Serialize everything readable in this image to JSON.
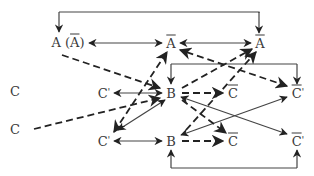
{
  "diagram": {
    "nodes": [
      {
        "id": "A",
        "label": "A (Ā)",
        "x": 68,
        "y": 41
      },
      {
        "id": "Abar1",
        "label": "Ā",
        "x": 170,
        "y": 43
      },
      {
        "id": "Abar2",
        "label": "Ā",
        "x": 260,
        "y": 43
      },
      {
        "id": "C_top",
        "label": "C",
        "x": 15,
        "y": 90
      },
      {
        "id": "C_bottom",
        "label": "C",
        "x": 15,
        "y": 128
      },
      {
        "id": "Cp_top",
        "label": "C'",
        "x": 104,
        "y": 93
      },
      {
        "id": "Cp_bottom",
        "label": "C'",
        "x": 104,
        "y": 141
      },
      {
        "id": "B_top",
        "label": "B",
        "x": 171,
        "y": 93
      },
      {
        "id": "B_bottom",
        "label": "B",
        "x": 171,
        "y": 141
      },
      {
        "id": "Cbar_top",
        "label": "C̄",
        "x": 232,
        "y": 93
      },
      {
        "id": "Cbar_bottom",
        "label": "C̄",
        "x": 232,
        "y": 141
      },
      {
        "id": "Cbarp_top",
        "label": "C̄'",
        "x": 297,
        "y": 93
      },
      {
        "id": "Cbarp_bottom",
        "label": "C̄'",
        "x": 297,
        "y": 141
      }
    ],
    "edges": [
      {
        "from": "top-bracket",
        "to": "A",
        "style": "solid",
        "note": "bracket from top line down to A and Ā(right)"
      },
      {
        "from": "Abar1",
        "to": "A",
        "style": "solid",
        "arrows": "both"
      },
      {
        "from": "Abar1",
        "to": "Abar2",
        "style": "solid",
        "arrows": "both"
      },
      {
        "from": "A",
        "to": "B_top",
        "style": "dashed"
      },
      {
        "from": "C_bottom",
        "to": "B_top",
        "style": "dashed"
      },
      {
        "from": "B_top",
        "to": "Cp_top",
        "style": "solid",
        "arrows": "both"
      },
      {
        "from": "B_bottom",
        "to": "Cp_bottom",
        "style": "solid",
        "arrows": "both"
      },
      {
        "from": "B_top",
        "to": "Cbar_top",
        "style": "dashed"
      },
      {
        "from": "B_bottom",
        "to": "Cbar_bottom",
        "style": "dashed"
      },
      {
        "from": "Cbarp_top",
        "to": "Abar1",
        "style": "dashed",
        "arrows": "both"
      },
      {
        "from": "Cp_bottom",
        "to": "Abar1",
        "style": "dashed",
        "arrows": "both"
      },
      {
        "from": "Cp_bottom",
        "to": "Abar2",
        "style": "dashed"
      },
      {
        "from": "B_top",
        "to": "Abar2",
        "style": "dashed"
      },
      {
        "from": "B_top",
        "to": "Cbarp_bottom",
        "style": "solid"
      },
      {
        "from": "Cbarp_top",
        "to": "B_bottom",
        "style": "solid",
        "arrows": "both"
      },
      {
        "from": "B_top",
        "to": "Cbar_bottom",
        "style": "dashed"
      },
      {
        "from": "Cp_top",
        "to": "B_top",
        "style": "solid",
        "arrows": "both"
      },
      {
        "from": "mid-bracket",
        "to": "B_top",
        "style": "solid",
        "note": "bracket down to B and C̄'"
      },
      {
        "from": "bottom-bracket",
        "to": "B_bottom",
        "style": "solid",
        "note": "bracket up to B and C̄'"
      }
    ]
  }
}
